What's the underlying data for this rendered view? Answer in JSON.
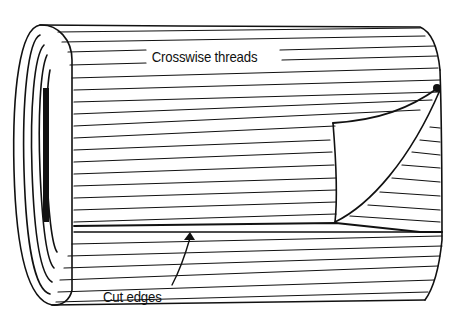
{
  "diagram": {
    "labels": {
      "crosswise_threads": "Crosswise threads",
      "cut_edges": "Cut edges"
    },
    "colors": {
      "ink": "#111111",
      "background": "#ffffff"
    }
  }
}
